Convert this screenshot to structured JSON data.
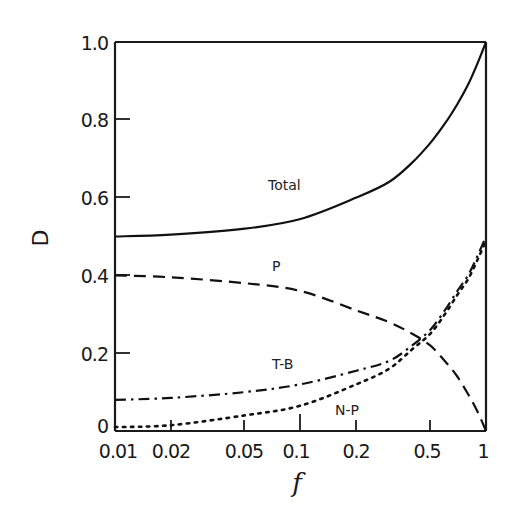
{
  "chart_data": {
    "type": "line",
    "title": "",
    "xlabel": "f",
    "ylabel": "D",
    "xscale": "log",
    "xlim": [
      0.01,
      1
    ],
    "ylim": [
      0,
      1.0
    ],
    "x_ticks": [
      "0.01",
      "0.02",
      "0.05",
      "0.1",
      "0.2",
      "0.5",
      "1"
    ],
    "y_ticks": [
      "0",
      "0.2",
      "0.4",
      "0.6",
      "0.8",
      "1.0"
    ],
    "grid": false,
    "legend": "inline labels",
    "x": [
      0.01,
      0.02,
      0.05,
      0.1,
      0.2,
      0.3,
      0.4,
      0.5,
      0.6,
      0.7,
      0.8,
      0.9,
      1.0
    ],
    "series": [
      {
        "name": "Total",
        "style": "solid",
        "values": [
          0.5,
          0.505,
          0.52,
          0.545,
          0.6,
          0.64,
          0.69,
          0.74,
          0.79,
          0.84,
          0.89,
          0.945,
          1.0
        ]
      },
      {
        "name": "P",
        "style": "dashed",
        "values": [
          0.4,
          0.395,
          0.38,
          0.36,
          0.31,
          0.28,
          0.25,
          0.22,
          0.18,
          0.14,
          0.095,
          0.05,
          0.0
        ]
      },
      {
        "name": "T-B",
        "style": "dash-dot",
        "values": [
          0.08,
          0.085,
          0.1,
          0.12,
          0.155,
          0.18,
          0.22,
          0.26,
          0.31,
          0.36,
          0.4,
          0.45,
          0.5
        ]
      },
      {
        "name": "N-P",
        "style": "dotted",
        "values": [
          0.01,
          0.015,
          0.04,
          0.065,
          0.12,
          0.16,
          0.21,
          0.25,
          0.3,
          0.35,
          0.39,
          0.44,
          0.49
        ]
      }
    ],
    "annotations": [
      {
        "text": "Total",
        "x": 0.12,
        "y": 0.64
      },
      {
        "text": "P",
        "x": 0.13,
        "y": 0.45
      },
      {
        "text": "T-B",
        "x": 0.12,
        "y": 0.2
      },
      {
        "text": "N-P",
        "x": 0.23,
        "y": 0.03
      }
    ]
  },
  "labels": {
    "ylabel": "D",
    "xlabel": "f",
    "total": "Total",
    "p": "P",
    "tb": "T-B",
    "np": "N-P"
  },
  "ticks": {
    "y": [
      "0",
      "0.2",
      "0.4",
      "0.6",
      "0.8",
      "1.0"
    ],
    "x": [
      "0.01",
      "0.02",
      "0.05",
      "0.1",
      "0.2",
      "0.5",
      "1"
    ]
  }
}
